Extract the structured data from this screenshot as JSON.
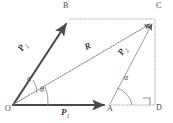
{
  "figure": {
    "width": 173,
    "height": 123,
    "background": "#ffffff"
  },
  "colors": {
    "solid_vector": "#4a4a4a",
    "dotted_light": "#b9b9b9",
    "resultant_dotted": "#9a9a9a",
    "label_text": "#3f3f3f",
    "arc": "#8c8c8c"
  },
  "points": [
    {
      "id": "O",
      "label": "O",
      "x": 13,
      "y": 105,
      "label_x": 6,
      "label_y": 107
    },
    {
      "id": "A",
      "label": "A",
      "x": 110,
      "y": 105,
      "label_x": 108,
      "label_y": 107
    },
    {
      "id": "B",
      "label": "B",
      "x": 68,
      "y": 20,
      "label_x": 63,
      "label_y": 3
    },
    {
      "id": "C",
      "label": "C",
      "x": 155,
      "y": 20,
      "label_x": 156,
      "label_y": 3
    },
    {
      "id": "D",
      "label": "D",
      "x": 155,
      "y": 105,
      "label_x": 156,
      "label_y": 107
    }
  ],
  "vectors": [
    {
      "name": "P2-OB",
      "label": "P",
      "subscript": "2",
      "from": "O",
      "to": "B",
      "style": "solid-arrow",
      "label_x": 22,
      "label_y": 47,
      "rotation": -60
    },
    {
      "name": "P1-OA",
      "label": "P",
      "subscript": "1",
      "from": "O",
      "to": "A",
      "style": "solid-arrow",
      "label_x": 62,
      "label_y": 110,
      "rotation": 0
    },
    {
      "name": "R-OC",
      "label": "R",
      "subscript": "",
      "from": "O",
      "to": "C",
      "style": "dotted-arrow",
      "label_x": 86,
      "label_y": 46,
      "rotation": -25
    },
    {
      "name": "P2-AC",
      "label": "P",
      "subscript": "2",
      "from": "A",
      "to": "C",
      "style": "thin-arrow",
      "label_x": 121,
      "label_y": 50,
      "rotation": -60
    }
  ],
  "construction_lines": [
    {
      "name": "BC-dotted",
      "from": "B",
      "to": "C",
      "style": "dotted"
    },
    {
      "name": "AD-dotted",
      "from": "A",
      "to": "D",
      "style": "dotted"
    },
    {
      "name": "CD-dotted",
      "from": "C",
      "to": "D",
      "style": "dotted"
    }
  ],
  "angles": [
    {
      "name": "alpha-at-O",
      "label": "α",
      "vertex": "O",
      "x": 29,
      "y": 79
    },
    {
      "name": "theta-at-O",
      "label": "θ",
      "vertex": "O",
      "x": 41,
      "y": 90
    },
    {
      "name": "alpha-at-A",
      "label": "α",
      "vertex": "A",
      "x": 126,
      "y": 78
    }
  ],
  "right_angle": {
    "name": "right-angle-at-D",
    "vertex": "D",
    "marker": "square"
  }
}
